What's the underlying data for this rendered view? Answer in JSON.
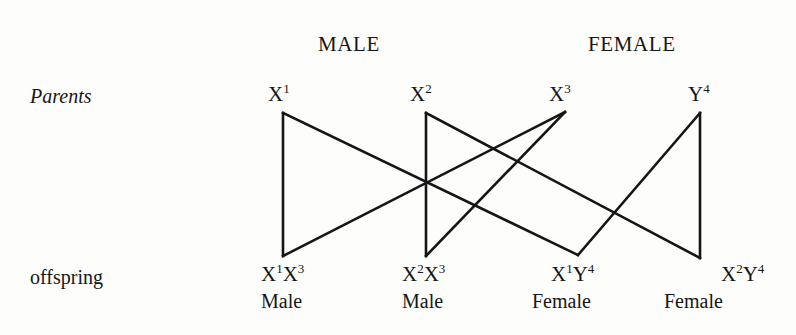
{
  "figure": {
    "background_color": "#fdfdfc",
    "line_color": "#151515",
    "width": 796,
    "height": 335
  },
  "group_headers": [
    {
      "label": "MALE",
      "x": 318,
      "y": 32
    },
    {
      "label": "FEMALE",
      "x": 588,
      "y": 32
    }
  ],
  "row_labels": [
    {
      "label": "Parents",
      "x": 30,
      "y": 85,
      "style": "italic"
    },
    {
      "label": "offspring",
      "x": 30,
      "y": 266,
      "style": "normal"
    }
  ],
  "parents": [
    {
      "id": "p1",
      "base": "X",
      "allele": "1",
      "label": "X1",
      "text_x": 268,
      "text_y": 84,
      "node_x": 283,
      "node_y": 113
    },
    {
      "id": "p2",
      "base": "X",
      "allele": "2",
      "label": "X2",
      "text_x": 410,
      "text_y": 84,
      "node_x": 426,
      "node_y": 113
    },
    {
      "id": "p3",
      "base": "X",
      "allele": "3",
      "label": "X3",
      "text_x": 549,
      "text_y": 84,
      "node_x": 565,
      "node_y": 112
    },
    {
      "id": "p4",
      "base": "Y",
      "allele": "4",
      "label": "Y4",
      "text_x": 688,
      "text_y": 84,
      "node_x": 700,
      "node_y": 113
    }
  ],
  "offspring": [
    {
      "id": "o1",
      "genotype": "X1X3",
      "first_base": "X",
      "first_allele": "1",
      "second_base": "X",
      "second_allele": "3",
      "sex": "Male",
      "text_x": 261,
      "text_y": 264,
      "sex_x": 261,
      "sex_y": 291,
      "node_x": 283,
      "node_y": 256
    },
    {
      "id": "o2",
      "genotype": "X2X3",
      "first_base": "X",
      "first_allele": "2",
      "second_base": "X",
      "second_allele": "3",
      "sex": "Male",
      "text_x": 402,
      "text_y": 264,
      "sex_x": 402,
      "sex_y": 291,
      "node_x": 426,
      "node_y": 256
    },
    {
      "id": "o3",
      "genotype": "X1Y4",
      "first_base": "X",
      "first_allele": "1",
      "second_base": "Y",
      "second_allele": "4",
      "sex": "Female",
      "text_x": 551,
      "text_y": 264,
      "sex_x": 532,
      "sex_y": 291,
      "node_x": 578,
      "node_y": 255
    },
    {
      "id": "o4",
      "genotype": "X2Y4",
      "first_base": "X",
      "first_allele": "2",
      "second_base": "Y",
      "second_allele": "4",
      "sex": "Female",
      "text_x": 721,
      "text_y": 264,
      "sex_x": 664,
      "sex_y": 291,
      "node_x": 700,
      "node_y": 258
    }
  ],
  "connectors": [
    {
      "id": "c1",
      "from": "p1",
      "to": "o1",
      "x1": 283,
      "y1": 113,
      "x2": 283,
      "y2": 256
    },
    {
      "id": "c2",
      "from": "p1",
      "to": "o3",
      "x1": 283,
      "y1": 113,
      "x2": 578,
      "y2": 255
    },
    {
      "id": "c3",
      "from": "p2",
      "to": "o2",
      "x1": 426,
      "y1": 113,
      "x2": 426,
      "y2": 256
    },
    {
      "id": "c4",
      "from": "p2",
      "to": "o4",
      "x1": 426,
      "y1": 113,
      "x2": 700,
      "y2": 258
    },
    {
      "id": "c5",
      "from": "p3",
      "to": "o1",
      "x1": 565,
      "y1": 112,
      "x2": 283,
      "y2": 256
    },
    {
      "id": "c6",
      "from": "p3",
      "to": "o2",
      "x1": 565,
      "y1": 112,
      "x2": 426,
      "y2": 256
    },
    {
      "id": "c7",
      "from": "p4",
      "to": "o4",
      "x1": 700,
      "y1": 113,
      "x2": 700,
      "y2": 258
    },
    {
      "id": "c8",
      "from": "p4",
      "to": "o3",
      "x1": 700,
      "y1": 113,
      "x2": 578,
      "y2": 255
    }
  ]
}
